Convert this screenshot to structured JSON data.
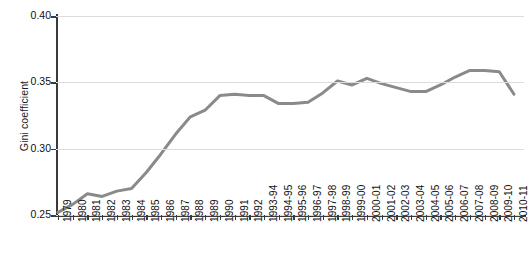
{
  "chart_data": {
    "type": "line",
    "title": "",
    "xlabel": "",
    "ylabel": "Gini coefficient",
    "ylim": [
      0.25,
      0.4
    ],
    "yticks": [
      "0.25",
      "0.30",
      "0.35",
      "0.40"
    ],
    "ytick_values": [
      0.25,
      0.3,
      0.35,
      0.4
    ],
    "grid": true,
    "legend": "none",
    "line_color": "#8a8a8a",
    "categories": [
      "1979",
      "1980",
      "1981",
      "1982",
      "1983",
      "1984",
      "1985",
      "1986",
      "1987",
      "1988",
      "1989",
      "1990",
      "1991",
      "1992",
      "1993-94",
      "1994-95",
      "1995-96",
      "1996-97",
      "1997-98",
      "1998-99",
      "1999-00",
      "2000-01",
      "2001-02",
      "2002-03",
      "2003-04",
      "2004-05",
      "2005-06",
      "2006-07",
      "2007-08",
      "2008-09",
      "2009-10",
      "2010-11"
    ],
    "series": [
      {
        "name": "Gini coefficient",
        "values": [
          0.252,
          0.258,
          0.266,
          0.264,
          0.268,
          0.27,
          0.282,
          0.296,
          0.311,
          0.324,
          0.329,
          0.34,
          0.341,
          0.34,
          0.34,
          0.334,
          0.334,
          0.335,
          0.342,
          0.351,
          0.348,
          0.353,
          0.349,
          0.346,
          0.343,
          0.343,
          0.348,
          0.354,
          0.359,
          0.359,
          0.358,
          0.341
        ]
      }
    ]
  },
  "figure": {
    "caption": ""
  }
}
